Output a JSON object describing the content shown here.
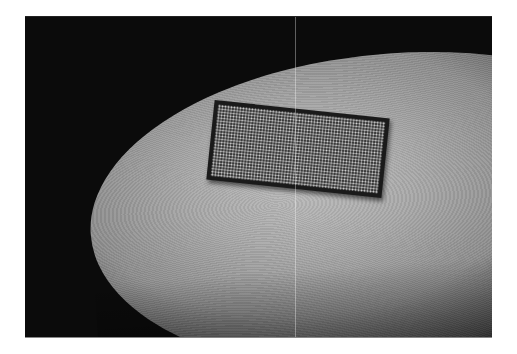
{
  "image": {
    "subject": "fingertip-with-microchip",
    "description": "Grayscale photo of a fingertip holding a small rectangular chip covered in a fine grid of dots, against a dark background",
    "colors": {
      "background": "#0b0b0b",
      "skin_light": "#bcbcbc",
      "skin_mid": "#8e8e8e",
      "chip_border": "#1a1a1a",
      "chip_surface": "#3a3a3a",
      "chip_dots": "#d6d6d6",
      "page": "#ffffff"
    }
  }
}
